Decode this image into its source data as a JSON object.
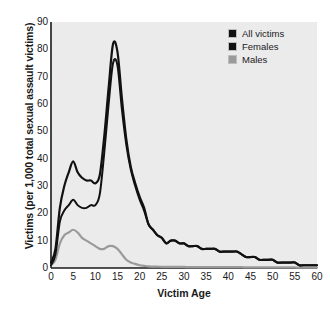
{
  "chart_data": {
    "type": "line",
    "title": "",
    "xlabel": "Victim Age",
    "ylabel": "Victims (per 1,000 total sexual assault victims)",
    "xlim": [
      0,
      60
    ],
    "ylim": [
      0,
      90
    ],
    "xticks": [
      0,
      5,
      10,
      15,
      20,
      25,
      30,
      35,
      40,
      45,
      50,
      55,
      60
    ],
    "yticks": [
      0,
      10,
      20,
      30,
      40,
      50,
      60,
      70,
      80,
      90
    ],
    "grid": false,
    "legend_position": "top-right",
    "plot_background": "#ebebeb",
    "x": [
      0,
      1,
      2,
      3,
      4,
      5,
      6,
      7,
      8,
      9,
      10,
      11,
      12,
      13,
      14,
      15,
      16,
      17,
      18,
      19,
      20,
      21,
      22,
      23,
      24,
      25,
      26,
      27,
      28,
      29,
      30,
      31,
      32,
      33,
      34,
      35,
      36,
      37,
      38,
      39,
      40,
      41,
      42,
      43,
      44,
      45,
      46,
      47,
      48,
      49,
      50,
      51,
      52,
      53,
      54,
      55,
      56,
      57,
      58,
      59,
      60
    ],
    "series": [
      {
        "name": "All victims",
        "color": "#111111",
        "values": [
          2,
          7,
          22,
          30,
          35,
          39,
          35,
          33,
          32,
          32,
          31,
          34,
          48,
          66,
          82,
          79,
          62,
          47,
          37,
          31,
          26,
          22,
          16,
          14,
          12,
          11,
          9,
          10,
          10,
          9,
          9,
          8,
          8,
          8,
          7,
          7,
          7,
          7,
          6,
          6,
          6,
          6,
          6,
          5,
          4,
          4,
          4,
          3,
          3,
          3,
          3,
          2,
          2,
          2,
          2,
          2,
          1,
          1,
          1,
          1,
          1
        ]
      },
      {
        "name": "Females",
        "color": "#111111",
        "values": [
          1,
          5,
          17,
          21,
          23,
          25,
          23,
          22,
          22,
          23,
          23,
          27,
          42,
          60,
          75,
          74,
          58,
          45,
          36,
          30,
          25,
          21,
          16,
          14,
          12,
          11,
          9,
          10,
          10,
          9,
          9,
          8,
          8,
          8,
          7,
          7,
          7,
          7,
          6,
          6,
          6,
          6,
          6,
          5,
          4,
          4,
          4,
          3,
          3,
          3,
          3,
          2,
          2,
          2,
          2,
          2,
          1,
          1,
          1,
          1,
          1
        ]
      },
      {
        "name": "Males",
        "color": "#9a9a9a",
        "values": [
          1,
          3,
          9,
          12,
          13,
          14,
          13,
          11,
          10,
          9,
          8,
          7,
          7,
          8,
          8,
          7,
          5,
          3,
          2,
          1.5,
          1,
          0.8,
          0.6,
          0.5,
          0.5,
          0.4,
          0.4,
          0.4,
          0.4,
          0.4,
          0.4,
          0.3,
          0.3,
          0.3,
          0.3,
          0.3,
          0.3,
          0.3,
          0.3,
          0.3,
          0.3,
          0.3,
          0.3,
          0.3,
          0.2,
          0.2,
          0.2,
          0.2,
          0.2,
          0.2,
          0.2,
          0.2,
          0.2,
          0.2,
          0.2,
          0.2,
          0.1,
          0.1,
          0.1,
          0.1,
          0.1
        ]
      }
    ],
    "legend": [
      {
        "label": "All victims",
        "color": "#111111"
      },
      {
        "label": "Females",
        "color": "#111111"
      },
      {
        "label": "Males",
        "color": "#9a9a9a"
      }
    ]
  }
}
